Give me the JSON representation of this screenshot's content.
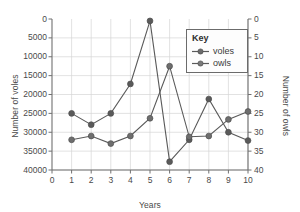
{
  "chart_data": {
    "type": "line",
    "title": "",
    "xlabel": "Years",
    "ylabel": "Number of voles",
    "y2label": "Number of owls",
    "x": [
      1,
      2,
      3,
      4,
      5,
      6,
      7,
      8,
      9,
      10
    ],
    "xlim": [
      0,
      10
    ],
    "ylim": [
      0,
      40000
    ],
    "y2lim": [
      0,
      40
    ],
    "xticks": [
      "0",
      "1",
      "2",
      "3",
      "4",
      "5",
      "6",
      "7",
      "8",
      "9",
      "10"
    ],
    "yticks": [
      "0",
      "5000",
      "10000",
      "15000",
      "20000",
      "25000",
      "30000",
      "35000",
      "40000"
    ],
    "y2ticks": [
      "0",
      "5",
      "10",
      "15",
      "20",
      "25",
      "30",
      "35",
      "40"
    ],
    "grid": true,
    "legend_position": "upper right",
    "series": [
      {
        "name": "voles",
        "axis": "left",
        "color": "#5a5a5a",
        "values": [
          15000,
          12000,
          15000,
          22800,
          39500,
          2200,
          8000,
          18800,
          10000,
          7800
        ]
      },
      {
        "name": "owls",
        "axis": "right",
        "color": "#6e6e6e",
        "values": [
          8.0,
          9.0,
          7.0,
          9.0,
          13.7,
          27.5,
          8.8,
          9.0,
          13.4,
          15.5
        ]
      }
    ]
  },
  "legend": {
    "title": "Key",
    "items": [
      {
        "label": "voles"
      },
      {
        "label": "owls"
      }
    ]
  },
  "colors": {
    "line": "#5a5a5a",
    "marker": "#6b6b6b",
    "grid": "#d6d6d6",
    "axis": "#707070",
    "text": "#4a4a4a"
  }
}
